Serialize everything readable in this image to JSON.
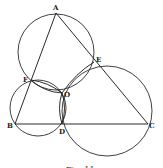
{
  "figure": {
    "caption": "Fig. 11",
    "points": {
      "A": {
        "label": "A",
        "x": 56,
        "y": 13
      },
      "B": {
        "label": "B",
        "x": 15,
        "y": 124
      },
      "C": {
        "label": "C",
        "x": 148,
        "y": 124
      },
      "D": {
        "label": "D",
        "x": 62,
        "y": 124
      },
      "E": {
        "label": "E",
        "x": 94,
        "y": 62
      },
      "F": {
        "label": "F",
        "x": 31,
        "y": 80
      },
      "O": {
        "label": "O",
        "x": 62,
        "y": 93
      }
    },
    "segments": [
      [
        "A",
        "B"
      ],
      [
        "A",
        "C"
      ],
      [
        "B",
        "C"
      ],
      [
        "F",
        "O"
      ],
      [
        "O",
        "D"
      ],
      [
        "O",
        "E"
      ]
    ],
    "circles": [
      {
        "name": "circle-AFE",
        "through": [
          "A",
          "F",
          "E",
          "O"
        ],
        "cx": 56,
        "cy": 52,
        "r": 38
      },
      {
        "name": "circle-BFD",
        "through": [
          "B",
          "F",
          "D",
          "O"
        ],
        "cx": 38,
        "cy": 108,
        "r": 28
      },
      {
        "name": "circle-CDE",
        "through": [
          "C",
          "D",
          "E",
          "O"
        ],
        "cx": 107,
        "cy": 111,
        "r": 45
      }
    ],
    "colors": {
      "stroke": "#2a2a2a",
      "background": "#ffffff"
    }
  }
}
